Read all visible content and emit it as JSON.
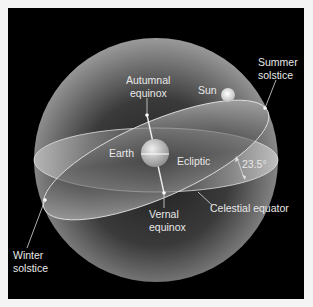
{
  "diagram": {
    "colors": {
      "background": "#000000",
      "frame": "#f4f4f4",
      "label": "#e8e8e8",
      "sphere": "#8a8a8a"
    },
    "labels": {
      "summer_solstice": [
        "Summer",
        "solstice"
      ],
      "autumnal_equinox": [
        "Autumnal",
        "equinox"
      ],
      "sun": "Sun",
      "earth": "Earth",
      "ecliptic": "Ecliptic",
      "angle": "23.5°",
      "celestial_equator": "Celestial equator",
      "vernal_equinox": [
        "Vernal",
        "equinox"
      ],
      "winter_solstice": [
        "Winter",
        "solstice"
      ]
    }
  }
}
